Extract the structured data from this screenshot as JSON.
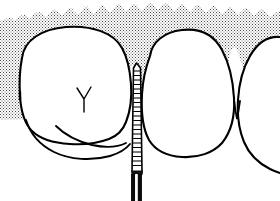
{
  "figure": {
    "title": "Periodontal probe inserted into interproximal gingival sulcus",
    "background_color": "#ffffff",
    "ink_color": "#000000",
    "stipple_color": "#555555",
    "width": 280,
    "height": 201
  },
  "elements": {
    "gingiva": {
      "label": "Gingiva (stippled gum tissue)",
      "fill_pattern": "stipple-dots",
      "pattern_spacing": 2
    },
    "left_tooth": {
      "label": "Left molar",
      "features": [
        "rounded crown",
        "Y-shaped developmental groove",
        "buccal cusp ridge"
      ]
    },
    "right_tooth": {
      "label": "Right molar",
      "features": [
        "oval crown",
        "smooth outline"
      ]
    },
    "distal_tooth": {
      "label": "Adjacent distal tooth (partial)",
      "features": [
        "partial crown at right edge"
      ]
    },
    "papilla": {
      "label": "Interdental papilla"
    },
    "probe": {
      "label": "Periodontal probe",
      "shaft_label": "Calibrated working tip",
      "handle_label": "Instrument handle",
      "marking_count": 22,
      "tip_y": 64,
      "handle_y": 174,
      "shaft_x": 133
    }
  }
}
